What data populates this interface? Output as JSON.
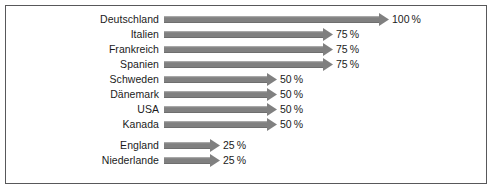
{
  "chart_data": {
    "type": "bar",
    "orientation": "horizontal",
    "title": "",
    "subtitle": "",
    "xlabel": "",
    "ylabel": "",
    "xlim": [
      0,
      100
    ],
    "grid": false,
    "legend": null,
    "unit": "%",
    "categories": [
      "Deutschland",
      "Italien",
      "Frankreich",
      "Spanien",
      "Schweden",
      "Dänemark",
      "USA",
      "Kanada",
      "England",
      "Niederlande"
    ],
    "values": [
      100,
      75,
      75,
      75,
      50,
      50,
      50,
      50,
      25,
      25
    ],
    "value_labels": [
      "100 %",
      "75 %",
      "75 %",
      "75 %",
      "50 %",
      "50 %",
      "50 %",
      "50 %",
      "25 %",
      "25 %"
    ]
  },
  "rows": [
    {
      "label": "Deutschland",
      "value": 100,
      "value_label": "100 %"
    },
    {
      "label": "Italien",
      "value": 75,
      "value_label": "75 %"
    },
    {
      "label": "Frankreich",
      "value": 75,
      "value_label": "75 %"
    },
    {
      "label": "Spanien",
      "value": 75,
      "value_label": "75 %"
    },
    {
      "label": "Schweden",
      "value": 50,
      "value_label": "50 %"
    },
    {
      "label": "Dänemark",
      "value": 50,
      "value_label": "50 %"
    },
    {
      "label": "USA",
      "value": 50,
      "value_label": "50 %"
    },
    {
      "label": "Kanada",
      "value": 50,
      "value_label": "50 %"
    },
    {
      "label": "England",
      "value": 25,
      "value_label": "25 %"
    },
    {
      "label": "Niederlande",
      "value": 25,
      "value_label": "25 %"
    }
  ],
  "colors": {
    "bar_fill": "#808080",
    "bar_highlight": "#a8a8a8",
    "bar_shadow": "#6e6e6e",
    "frame_border": "#58585a",
    "text": "#1b1b1b",
    "background": "#ffffff"
  }
}
